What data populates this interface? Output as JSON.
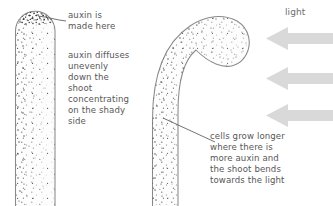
{
  "figure": {
    "background_color": "#ffffff",
    "width": 333,
    "height": 206
  },
  "labels": {
    "auxin_made": "auxin is\nmade here",
    "auxin_diffuses": "auxin diffuses\nunevenly\ndown the\nshoot\nconcentrating\non the shady\nside",
    "cells_grow": "cells grow longer\nwhere there is\nmore auxin and\nthe shoot bends\ntowards the light",
    "light": "light"
  },
  "diagram": {
    "left_shoot": {
      "name": "straight shoot",
      "description": "upright shoot with rounded tip, auxin stippling densest at tip and down the left side",
      "outline_color": "#8a8a8a",
      "fill_color": "#fcfcfc",
      "stipple_color": "#4a4a4a"
    },
    "right_shoot": {
      "name": "bent shoot",
      "description": "shoot curving over to the right toward the light, stippling concentrated on the shady outer left side",
      "outline_color": "#8a8a8a",
      "fill_color": "#fcfcfc",
      "stipple_color": "#4a4a4a"
    },
    "light_arrows": {
      "name": "light direction arrows",
      "count": 3,
      "direction": "leftward",
      "color": "#d9d9d9"
    },
    "leader_lines": {
      "color": "#5a5a5a"
    }
  },
  "colors": {
    "text": "#575757",
    "light_text": "#6d6d6d",
    "outline": "#8a8a8a",
    "arrow": "#d9d9d9",
    "stipple": "#4a4a4a"
  }
}
